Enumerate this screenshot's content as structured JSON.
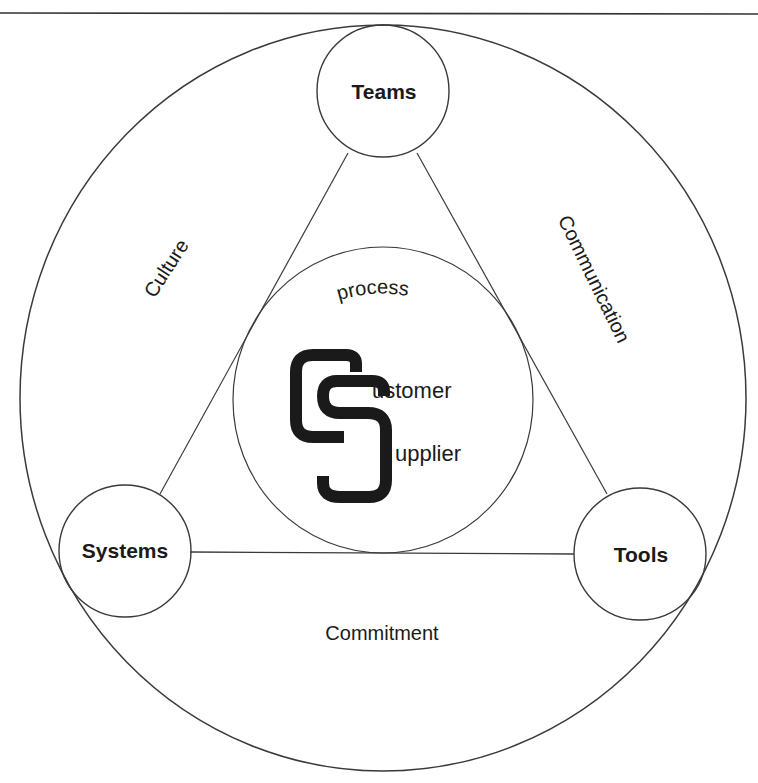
{
  "diagram": {
    "nodes": {
      "teams": {
        "label": "Teams"
      },
      "systems": {
        "label": "Systems"
      },
      "tools": {
        "label": "Tools"
      }
    },
    "relationships": {
      "culture": {
        "label": "Culture"
      },
      "communication": {
        "label": "Communication"
      },
      "commitment": {
        "label": "Commitment"
      }
    },
    "center": {
      "process_label": "process",
      "logo_letters": "CS",
      "customer_rest": "ustomer",
      "supplier_rest": "upplier"
    },
    "colors": {
      "line": "#3a3a3a",
      "text": "#1a1a1a",
      "logo": "#1a1a1a",
      "background": "#ffffff"
    }
  }
}
